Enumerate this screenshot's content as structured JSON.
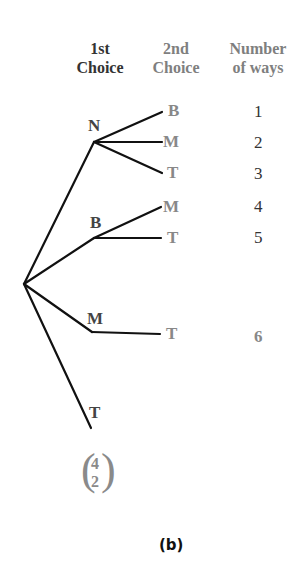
{
  "headers": {
    "first_line1": "1st",
    "first_line2": "Choice",
    "second_line1": "2nd",
    "second_line2": "Choice",
    "number_line1": "Number",
    "number_line2": "of ways"
  },
  "tree": {
    "first_choices": [
      "N",
      "B",
      "M",
      "T"
    ],
    "branches": [
      {
        "first": "N",
        "second": [
          "B",
          "M",
          "T"
        ],
        "ways": [
          "1",
          "2",
          "3"
        ]
      },
      {
        "first": "B",
        "second": [
          "M",
          "T"
        ],
        "ways": [
          "4",
          "5"
        ]
      },
      {
        "first": "M",
        "second": [
          "T"
        ],
        "ways": [
          "6"
        ]
      },
      {
        "first": "T",
        "second": [],
        "ways": []
      }
    ]
  },
  "binomial": {
    "top": "4",
    "bottom": "2"
  },
  "caption": "(b)",
  "colors": {
    "line": "#111111",
    "first_label": "#444444",
    "second_label": "#888888"
  }
}
